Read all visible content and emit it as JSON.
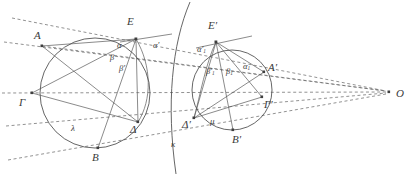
{
  "figure": {
    "type": "geometry-diagram",
    "background_color": "#ffffff",
    "stroke_color": "#4a4a4a",
    "dash_color": "#6e6e6e",
    "label_color": "#3a3a3a",
    "width": 412,
    "height": 176
  },
  "points": [
    {
      "id": "A",
      "label": "A",
      "x": 42,
      "y": 46,
      "label_x": 34,
      "label_y": 30
    },
    {
      "id": "E",
      "label": "E",
      "x": 136,
      "y": 39,
      "label_x": 127,
      "label_y": 18
    },
    {
      "id": "Gamma",
      "label": "Γ",
      "x": 32,
      "y": 93,
      "label_x": 19,
      "label_y": 97
    },
    {
      "id": "Delta",
      "label": "Δ",
      "x": 138,
      "y": 122,
      "label_x": 131,
      "label_y": 125
    },
    {
      "id": "B",
      "label": "B",
      "x": 98,
      "y": 148,
      "label_x": 92,
      "label_y": 152
    },
    {
      "id": "Eprime",
      "label": "E′",
      "x": 216,
      "y": 42,
      "label_x": 209,
      "label_y": 23
    },
    {
      "id": "Aprime",
      "label": "A′",
      "x": 264,
      "y": 72,
      "label_x": 266,
      "label_y": 62
    },
    {
      "id": "Gammaprime",
      "label": "Γ′",
      "x": 262,
      "y": 97,
      "label_x": 262,
      "label_y": 99
    },
    {
      "id": "Bprime",
      "label": "B′",
      "x": 233,
      "y": 130,
      "label_x": 233,
      "label_y": 133
    },
    {
      "id": "Deltaprime",
      "label": "Δ′",
      "x": 194,
      "y": 118,
      "label_x": 184,
      "label_y": 120
    },
    {
      "id": "O",
      "label": "O",
      "x": 389,
      "y": 92,
      "label_x": 394,
      "label_y": 90
    }
  ],
  "angle_labels": [
    {
      "id": "alpha",
      "base": "α",
      "sub": "",
      "prime": "",
      "x": 117,
      "y": 44
    },
    {
      "id": "beta",
      "base": "β",
      "sub": "",
      "prime": "",
      "x": 110,
      "y": 57
    },
    {
      "id": "beta-prime",
      "base": "β",
      "sub": "",
      "prime": "′",
      "x": 118,
      "y": 67
    },
    {
      "id": "alpha-prime",
      "base": "α",
      "sub": "",
      "prime": "′",
      "x": 152,
      "y": 44
    },
    {
      "id": "alpha-prime-1",
      "base": "α",
      "sub": "1",
      "prime": "′",
      "x": 199,
      "y": 48
    },
    {
      "id": "beta-prime-1",
      "base": "β",
      "sub": "1",
      "prime": "′",
      "x": 208,
      "y": 70
    },
    {
      "id": "beta-1",
      "base": "β",
      "sub": "1",
      "prime": "",
      "x": 227,
      "y": 70
    },
    {
      "id": "alpha-1",
      "base": "α",
      "sub": "1",
      "prime": "",
      "x": 244,
      "y": 66
    }
  ],
  "curve_labels": [
    {
      "id": "lambda",
      "label": "λ",
      "x": 72,
      "y": 128
    },
    {
      "id": "mu",
      "label": "μ",
      "x": 211,
      "y": 121
    },
    {
      "id": "kappa",
      "label": "κ",
      "x": 172,
      "y": 144
    }
  ],
  "curves": {
    "circle_lambda": {
      "cx": 95,
      "cy": 93,
      "r": 55
    },
    "circle_mu": {
      "cx": 232,
      "cy": 90,
      "r": 40
    },
    "arc_kappa_label": "κ",
    "arc_E_Delta_label": "",
    "arc_Eprime_Deltaprime_label": ""
  },
  "pencil_lines": {
    "apex_label": "O",
    "count": 5,
    "description": "dashed lines through the figure converging at O"
  }
}
